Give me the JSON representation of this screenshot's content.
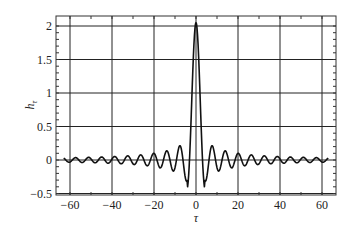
{
  "chart_data": {
    "type": "line",
    "title": "",
    "xlabel": "τ",
    "ylabel": "h_τ",
    "ylabel_main": "h",
    "ylabel_sub": "τ",
    "xlim": [
      -64,
      64
    ],
    "ylim": [
      -0.5,
      2.15
    ],
    "xticks": [
      -60,
      -40,
      -20,
      0,
      20,
      40,
      60
    ],
    "xtick_labels": [
      "−60",
      "−40",
      "−20",
      "0",
      "20",
      "40",
      "60"
    ],
    "yticks": [
      -0.5,
      0,
      0.5,
      1,
      1.5,
      2
    ],
    "ytick_labels": [
      "−0.5",
      "0",
      "0.5",
      "1",
      "1.5",
      "2"
    ],
    "grid": true,
    "legend": null,
    "series": [
      {
        "name": "h_tau",
        "description": "Symmetric sinc-like oscillation: peak ≈2.05 at τ=0, first minima ≈ -0.42 at τ≈±4, decaying ripple with period ≈6 out to τ=±63",
        "x": [
          -63,
          -60,
          -57,
          -54,
          -51,
          -48,
          -45,
          -42,
          -39,
          -36,
          -33,
          -30,
          -27,
          -24,
          -21,
          -18,
          -15,
          -12,
          -9,
          -7,
          -5,
          -4,
          -3,
          -2,
          -1,
          0,
          1,
          2,
          3,
          4,
          5,
          7,
          9,
          12,
          15,
          18,
          21,
          24,
          27,
          30,
          33,
          36,
          39,
          42,
          45,
          48,
          51,
          54,
          57,
          60,
          63
        ],
        "values": [
          0.0,
          0.03,
          -0.04,
          0.05,
          -0.05,
          0.06,
          -0.06,
          0.07,
          -0.08,
          0.08,
          -0.1,
          0.1,
          -0.12,
          0.13,
          -0.15,
          0.17,
          -0.2,
          0.23,
          -0.3,
          0.3,
          -0.3,
          -0.42,
          0.1,
          0.9,
          1.7,
          2.05,
          1.7,
          0.9,
          0.1,
          -0.42,
          -0.3,
          0.3,
          -0.3,
          0.23,
          -0.2,
          0.17,
          -0.15,
          0.13,
          -0.12,
          0.1,
          -0.1,
          0.08,
          -0.08,
          0.07,
          -0.06,
          0.06,
          -0.05,
          0.05,
          -0.04,
          0.03,
          0.0
        ]
      }
    ]
  },
  "style": {
    "line_color": "#111111",
    "grid_color": "#222222",
    "frame_color": "#333333",
    "background": "#ffffff"
  }
}
